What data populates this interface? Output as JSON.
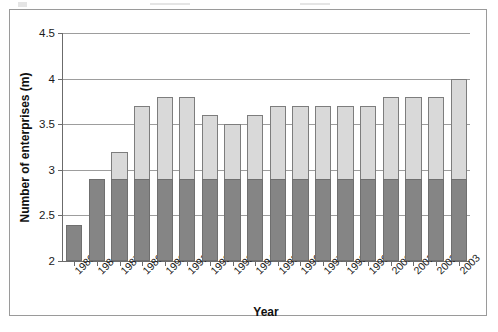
{
  "chart_data": {
    "type": "bar",
    "title": "",
    "xlabel": "Year",
    "ylabel": "Number of enterprises (m)",
    "ylim": [
      2,
      4.5
    ],
    "ytick_labels": [
      "2",
      "2.5",
      "3",
      "3.5",
      "4",
      "4.5"
    ],
    "ytick_values": [
      2,
      2.5,
      3,
      3.5,
      4,
      4.5
    ],
    "grid": true,
    "legend": "none",
    "stacked": true,
    "segment_split_value": 2.9,
    "categories": [
      "1980",
      "1984",
      "1987",
      "1989",
      "1990",
      "1991",
      "1992",
      "1993",
      "1994",
      "1995",
      "1996",
      "1997",
      "1998",
      "1999",
      "2000",
      "2001",
      "2002",
      "2003"
    ],
    "values": [
      2.4,
      2.9,
      3.2,
      3.7,
      3.8,
      3.8,
      3.6,
      3.5,
      3.6,
      3.7,
      3.7,
      3.7,
      3.7,
      3.7,
      3.8,
      3.8,
      3.8,
      4.0
    ],
    "series": [
      {
        "name": "lower-segment",
        "color": "#858585",
        "values": [
          2.4,
          2.9,
          2.9,
          2.9,
          2.9,
          2.9,
          2.9,
          2.9,
          2.9,
          2.9,
          2.9,
          2.9,
          2.9,
          2.9,
          2.9,
          2.9,
          2.9,
          2.9
        ]
      },
      {
        "name": "upper-segment",
        "color": "#d9d9d9",
        "values": [
          0.0,
          0.0,
          0.3,
          0.8,
          0.9,
          0.9,
          0.7,
          0.6,
          0.7,
          0.8,
          0.8,
          0.8,
          0.8,
          0.8,
          0.9,
          0.9,
          0.9,
          1.1
        ]
      }
    ],
    "colors": {
      "bar_upper": "#d9d9d9",
      "bar_lower": "#858585",
      "bar_border": "#7d7d7d",
      "gridline": "#9d9d9d",
      "axis": "#6b6b6b",
      "frame": "#9a9a9a",
      "text": "#1a1a1a"
    }
  }
}
